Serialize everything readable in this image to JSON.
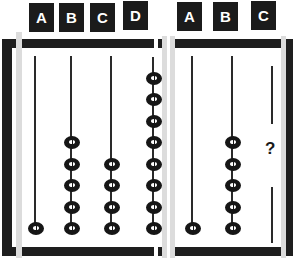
{
  "figure": {
    "colors": {
      "frame": "#1e1e1e",
      "bead": "#161616",
      "label_bg": "#1b1b1b",
      "label_text": "#ffffff",
      "ghost_bar": "#dcdcdc"
    }
  },
  "left_abacus": {
    "columns": [
      {
        "label": "A",
        "beads": 1
      },
      {
        "label": "B",
        "beads": 5
      },
      {
        "label": "C",
        "beads": 4
      },
      {
        "label": "D",
        "beads": 8
      }
    ]
  },
  "right_abacus": {
    "columns": [
      {
        "label": "A",
        "beads": 1
      },
      {
        "label": "B",
        "beads": 5
      },
      {
        "label": "C",
        "beads": null,
        "unknown_symbol": "?"
      }
    ]
  }
}
